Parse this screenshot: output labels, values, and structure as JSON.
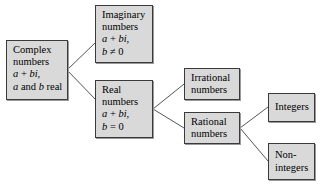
{
  "diagram": {
    "colors": {
      "box_fill": "#d9d9d9",
      "box_border": "#3a3a3a",
      "box_shadow": "#9a9a9a",
      "connector": "#555555",
      "background": "#ffffff",
      "text": "#000000"
    },
    "nodes": {
      "complex": {
        "name": "Complex numbers",
        "line1": "Complex",
        "line2": "numbers",
        "line3_a": "a",
        "line3_op": " + ",
        "line3_b": "bi",
        "line3_tail": ",",
        "line4_a": "a",
        "line4_mid": " and ",
        "line4_b": "b",
        "line4_tail": " real"
      },
      "imaginary": {
        "name": "Imaginary numbers",
        "line1": "Imaginary",
        "line2": "numbers",
        "line3_a": "a",
        "line3_op": " + ",
        "line3_b": "bi",
        "line3_tail": ",",
        "line4_var": "b",
        "line4_rel": " ≠ 0"
      },
      "real": {
        "name": "Real numbers",
        "line1": "Real",
        "line2": "numbers",
        "line3_a": "a",
        "line3_op": " + ",
        "line3_b": "bi",
        "line3_tail": ",",
        "line4_var": "b",
        "line4_rel": " = 0"
      },
      "irrational": {
        "name": "Irrational numbers",
        "line1": "Irrational",
        "line2": "numbers"
      },
      "rational": {
        "name": "Rational numbers",
        "line1": "Rational",
        "line2": "numbers"
      },
      "integers": {
        "name": "Integers",
        "line1": "Integers"
      },
      "nonintegers": {
        "name": "Non-integers",
        "line1": "Non-",
        "line2": "integers"
      }
    },
    "edges": [
      {
        "name": "complex-to-imaginary",
        "from": "complex",
        "to": "imaginary"
      },
      {
        "name": "complex-to-real",
        "from": "complex",
        "to": "real"
      },
      {
        "name": "real-to-irrational",
        "from": "real",
        "to": "irrational"
      },
      {
        "name": "real-to-rational",
        "from": "real",
        "to": "rational"
      },
      {
        "name": "rational-to-integers",
        "from": "rational",
        "to": "integers"
      },
      {
        "name": "rational-to-nonintegers",
        "from": "rational",
        "to": "nonintegers"
      }
    ]
  }
}
